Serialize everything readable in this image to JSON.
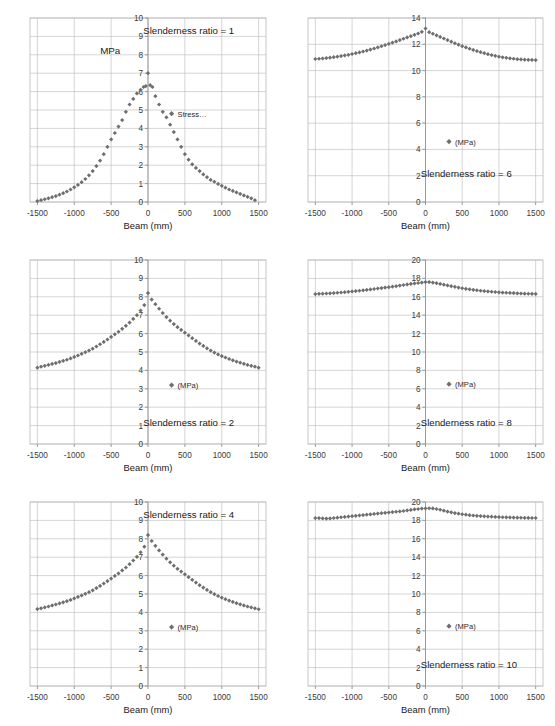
{
  "figure": {
    "layout": "2 columns x 3 rows of scatter plots",
    "background_color": "#ffffff",
    "marker_color": "#6e6e6e",
    "grid_color": "#b9b9b9",
    "axis_color": "#9a9a9a",
    "text_color": "#1a1a1a"
  },
  "shared": {
    "xlabel": "Beam (mm)",
    "xticks": [
      "-1500",
      "-1000",
      "-500",
      "0",
      "500",
      "1000",
      "1500"
    ],
    "unit_label": "MPa",
    "legend_mpa": "(MPa)",
    "legend_stress": "Stress…",
    "marker_symbol": "diamond"
  },
  "chart_data": [
    {
      "type": "scatter",
      "title": "",
      "annotation": "Slenderness ratio = 1",
      "annotation_pos": "top-right",
      "legend": [
        "Stress…"
      ],
      "legend_pos": "right-middle",
      "extra_label": "MPa",
      "xlabel": "Beam (mm)",
      "ylabel": "",
      "xlim": [
        -1600,
        1600
      ],
      "ylim": [
        0,
        10
      ],
      "yticks": [
        0,
        1,
        2,
        3,
        4,
        5,
        6,
        7,
        8,
        9,
        10
      ],
      "xticks": [
        -1500,
        -1000,
        -500,
        0,
        500,
        1000,
        1500
      ],
      "grid": true,
      "peak_value": 7.0,
      "edge_value": 0.05,
      "x": [
        -1500,
        -1450,
        -1400,
        -1350,
        -1300,
        -1250,
        -1200,
        -1150,
        -1100,
        -1050,
        -1000,
        -950,
        -900,
        -850,
        -800,
        -750,
        -700,
        -650,
        -600,
        -550,
        -500,
        -450,
        -400,
        -350,
        -300,
        -250,
        -200,
        -150,
        -100,
        -60,
        -30,
        0,
        30,
        60,
        100,
        150,
        200,
        250,
        300,
        350,
        400,
        450,
        500,
        550,
        600,
        650,
        700,
        750,
        800,
        850,
        900,
        950,
        1000,
        1050,
        1100,
        1150,
        1200,
        1250,
        1300,
        1350,
        1400,
        1450
      ],
      "y": [
        0.05,
        0.1,
        0.15,
        0.2,
        0.26,
        0.32,
        0.4,
        0.48,
        0.57,
        0.68,
        0.8,
        0.93,
        1.08,
        1.25,
        1.45,
        1.68,
        1.95,
        2.25,
        2.6,
        3.0,
        3.4,
        3.75,
        4.1,
        4.45,
        4.9,
        5.3,
        5.6,
        5.9,
        6.1,
        6.25,
        6.3,
        7.0,
        6.35,
        6.25,
        5.75,
        5.3,
        4.9,
        4.6,
        4.2,
        3.8,
        3.4,
        3.0,
        2.6,
        2.3,
        2.05,
        1.85,
        1.68,
        1.5,
        1.35,
        1.2,
        1.1,
        0.98,
        0.88,
        0.78,
        0.68,
        0.6,
        0.52,
        0.44,
        0.36,
        0.28,
        0.2,
        0.1
      ]
    },
    {
      "type": "scatter",
      "title": "",
      "annotation": "Slenderness ratio = 6",
      "annotation_pos": "bottom-right",
      "legend": [
        "(MPa)"
      ],
      "legend_pos": "right-middle",
      "xlabel": "Beam (mm)",
      "ylabel": "",
      "xlim": [
        -1600,
        1600
      ],
      "ylim": [
        0,
        14
      ],
      "yticks": [
        0,
        2,
        4,
        6,
        8,
        10,
        12,
        14
      ],
      "xticks": [
        -1500,
        -1000,
        -500,
        0,
        500,
        1000,
        1500
      ],
      "grid": true,
      "peak_value": 13.2,
      "edge_value": 10.9,
      "x": [
        -1500,
        -1450,
        -1400,
        -1350,
        -1300,
        -1250,
        -1200,
        -1150,
        -1100,
        -1050,
        -1000,
        -950,
        -900,
        -850,
        -800,
        -750,
        -700,
        -650,
        -600,
        -550,
        -500,
        -450,
        -400,
        -350,
        -300,
        -250,
        -200,
        -150,
        -100,
        -50,
        0,
        50,
        100,
        150,
        200,
        250,
        300,
        350,
        400,
        450,
        500,
        550,
        600,
        650,
        700,
        750,
        800,
        850,
        900,
        950,
        1000,
        1050,
        1100,
        1150,
        1200,
        1250,
        1300,
        1350,
        1400,
        1450,
        1500
      ],
      "y": [
        10.88,
        10.9,
        10.92,
        10.95,
        10.98,
        11.02,
        11.06,
        11.1,
        11.15,
        11.2,
        11.26,
        11.32,
        11.38,
        11.45,
        11.52,
        11.6,
        11.68,
        11.76,
        11.85,
        11.94,
        12.03,
        12.12,
        12.22,
        12.32,
        12.42,
        12.52,
        12.62,
        12.72,
        12.82,
        12.95,
        13.2,
        12.92,
        12.8,
        12.68,
        12.56,
        12.44,
        12.32,
        12.2,
        12.08,
        11.97,
        11.86,
        11.76,
        11.66,
        11.57,
        11.48,
        11.4,
        11.32,
        11.25,
        11.18,
        11.12,
        11.06,
        11.01,
        10.97,
        10.93,
        10.9,
        10.87,
        10.85,
        10.83,
        10.82,
        10.81,
        10.8
      ]
    },
    {
      "type": "scatter",
      "title": "",
      "annotation": "Slenderness ratio = 2",
      "annotation_pos": "bottom-right",
      "legend": [
        "(MPa)"
      ],
      "legend_pos": "right-middle",
      "xlabel": "Beam (mm)",
      "ylabel": "",
      "xlim": [
        -1600,
        1600
      ],
      "ylim": [
        0,
        10
      ],
      "yticks": [
        0,
        1,
        2,
        3,
        4,
        5,
        6,
        7,
        8,
        9,
        10
      ],
      "xticks": [
        -1500,
        -1000,
        -500,
        0,
        500,
        1000,
        1500
      ],
      "grid": true,
      "peak_value": 8.2,
      "edge_value": 4.15,
      "x": [
        -1500,
        -1450,
        -1400,
        -1350,
        -1300,
        -1250,
        -1200,
        -1150,
        -1100,
        -1050,
        -1000,
        -950,
        -900,
        -850,
        -800,
        -750,
        -700,
        -650,
        -600,
        -550,
        -500,
        -450,
        -400,
        -350,
        -300,
        -250,
        -200,
        -150,
        -100,
        -50,
        0,
        50,
        100,
        150,
        200,
        250,
        300,
        350,
        400,
        450,
        500,
        550,
        600,
        650,
        700,
        750,
        800,
        850,
        900,
        950,
        1000,
        1050,
        1100,
        1150,
        1200,
        1250,
        1300,
        1350,
        1400,
        1450,
        1500
      ],
      "y": [
        4.15,
        4.2,
        4.25,
        4.3,
        4.35,
        4.4,
        4.46,
        4.52,
        4.58,
        4.65,
        4.73,
        4.81,
        4.9,
        4.99,
        5.08,
        5.18,
        5.3,
        5.42,
        5.55,
        5.68,
        5.82,
        5.96,
        6.1,
        6.26,
        6.42,
        6.6,
        6.8,
        7.0,
        7.25,
        7.55,
        8.2,
        7.85,
        7.6,
        7.35,
        7.12,
        6.9,
        6.7,
        6.52,
        6.35,
        6.2,
        6.05,
        5.9,
        5.75,
        5.6,
        5.46,
        5.33,
        5.2,
        5.08,
        4.97,
        4.87,
        4.78,
        4.7,
        4.62,
        4.55,
        4.48,
        4.42,
        4.36,
        4.3,
        4.25,
        4.2,
        4.15
      ]
    },
    {
      "type": "scatter",
      "title": "",
      "annotation": "Slenderness ratio = 8",
      "annotation_pos": "bottom-right",
      "legend": [
        "(MPa)"
      ],
      "legend_pos": "right-middle",
      "xlabel": "Beam (mm)",
      "ylabel": "",
      "xlim": [
        -1600,
        1600
      ],
      "ylim": [
        0,
        20
      ],
      "yticks": [
        0,
        2,
        4,
        6,
        8,
        10,
        12,
        14,
        16,
        18,
        20
      ],
      "xticks": [
        -1500,
        -1000,
        -500,
        0,
        500,
        1000,
        1500
      ],
      "grid": true,
      "peak_value": 17.6,
      "edge_value": 16.3,
      "x": [
        -1500,
        -1450,
        -1400,
        -1350,
        -1300,
        -1250,
        -1200,
        -1150,
        -1100,
        -1050,
        -1000,
        -950,
        -900,
        -850,
        -800,
        -750,
        -700,
        -650,
        -600,
        -550,
        -500,
        -450,
        -400,
        -350,
        -300,
        -250,
        -200,
        -150,
        -100,
        -50,
        0,
        50,
        100,
        150,
        200,
        250,
        300,
        350,
        400,
        450,
        500,
        550,
        600,
        650,
        700,
        750,
        800,
        850,
        900,
        950,
        1000,
        1050,
        1100,
        1150,
        1200,
        1250,
        1300,
        1350,
        1400,
        1450,
        1500
      ],
      "y": [
        16.3,
        16.32,
        16.34,
        16.36,
        16.38,
        16.41,
        16.44,
        16.47,
        16.5,
        16.54,
        16.58,
        16.62,
        16.66,
        16.7,
        16.75,
        16.8,
        16.85,
        16.9,
        16.95,
        17.0,
        17.05,
        17.1,
        17.16,
        17.22,
        17.28,
        17.34,
        17.4,
        17.45,
        17.5,
        17.55,
        17.6,
        17.6,
        17.55,
        17.48,
        17.4,
        17.32,
        17.24,
        17.16,
        17.08,
        17.0,
        16.93,
        16.87,
        16.81,
        16.76,
        16.71,
        16.66,
        16.62,
        16.58,
        16.55,
        16.52,
        16.49,
        16.46,
        16.44,
        16.42,
        16.4,
        16.38,
        16.36,
        16.34,
        16.33,
        16.32,
        16.31
      ]
    },
    {
      "type": "scatter",
      "title": "",
      "annotation": "Slenderness ratio = 4",
      "annotation_pos": "top-right",
      "legend": [
        "(MPa)"
      ],
      "legend_pos": "right-middle",
      "xlabel": "Beam (mm)",
      "ylabel": "",
      "xlim": [
        -1600,
        1600
      ],
      "ylim": [
        0,
        10
      ],
      "yticks": [
        0,
        1,
        2,
        3,
        4,
        5,
        6,
        7,
        8,
        9,
        10
      ],
      "xticks": [
        -1500,
        -1000,
        -500,
        0,
        500,
        1000,
        1500
      ],
      "grid": true,
      "peak_value": 8.2,
      "edge_value": 4.15,
      "x": [
        -1500,
        -1450,
        -1400,
        -1350,
        -1300,
        -1250,
        -1200,
        -1150,
        -1100,
        -1050,
        -1000,
        -950,
        -900,
        -850,
        -800,
        -750,
        -700,
        -650,
        -600,
        -550,
        -500,
        -450,
        -400,
        -350,
        -300,
        -250,
        -200,
        -150,
        -100,
        -50,
        0,
        50,
        100,
        150,
        200,
        250,
        300,
        350,
        400,
        450,
        500,
        550,
        600,
        650,
        700,
        750,
        800,
        850,
        900,
        950,
        1000,
        1050,
        1100,
        1150,
        1200,
        1250,
        1300,
        1350,
        1400,
        1450,
        1500
      ],
      "y": [
        4.18,
        4.22,
        4.27,
        4.32,
        4.38,
        4.43,
        4.49,
        4.55,
        4.61,
        4.68,
        4.76,
        4.84,
        4.92,
        5.01,
        5.1,
        5.2,
        5.32,
        5.44,
        5.57,
        5.7,
        5.84,
        5.98,
        6.12,
        6.28,
        6.44,
        6.62,
        6.82,
        7.02,
        7.27,
        7.57,
        8.2,
        7.88,
        7.62,
        7.37,
        7.14,
        6.92,
        6.72,
        6.54,
        6.37,
        6.22,
        6.07,
        5.92,
        5.77,
        5.62,
        5.48,
        5.35,
        5.22,
        5.1,
        4.99,
        4.89,
        4.8,
        4.72,
        4.64,
        4.57,
        4.5,
        4.44,
        4.38,
        4.32,
        4.27,
        4.22,
        4.17
      ]
    },
    {
      "type": "scatter",
      "title": "",
      "annotation": "Slenderness ratio = 10",
      "annotation_pos": "bottom-right",
      "legend": [
        "(MPa)"
      ],
      "legend_pos": "right-middle",
      "xlabel": "Beam (mm)",
      "ylabel": "",
      "xlim": [
        -1600,
        1600
      ],
      "ylim": [
        0,
        20
      ],
      "yticks": [
        0,
        2,
        4,
        6,
        8,
        10,
        12,
        14,
        16,
        18,
        20
      ],
      "xticks": [
        -1500,
        -1000,
        -500,
        0,
        500,
        1000,
        1500
      ],
      "grid": true,
      "peak_value": 19.3,
      "edge_value": 18.2,
      "x": [
        -1500,
        -1450,
        -1400,
        -1350,
        -1300,
        -1250,
        -1200,
        -1150,
        -1100,
        -1050,
        -1000,
        -950,
        -900,
        -850,
        -800,
        -750,
        -700,
        -650,
        -600,
        -550,
        -500,
        -450,
        -400,
        -350,
        -300,
        -250,
        -200,
        -150,
        -100,
        -50,
        0,
        50,
        100,
        150,
        200,
        250,
        300,
        350,
        400,
        450,
        500,
        550,
        600,
        650,
        700,
        750,
        800,
        850,
        900,
        950,
        1000,
        1050,
        1100,
        1150,
        1200,
        1250,
        1300,
        1350,
        1400,
        1450,
        1500
      ],
      "y": [
        18.25,
        18.25,
        18.22,
        18.2,
        18.22,
        18.26,
        18.3,
        18.34,
        18.38,
        18.42,
        18.46,
        18.5,
        18.54,
        18.58,
        18.62,
        18.66,
        18.7,
        18.74,
        18.78,
        18.82,
        18.86,
        18.9,
        18.94,
        18.98,
        19.02,
        19.08,
        19.14,
        19.2,
        19.24,
        19.28,
        19.3,
        19.32,
        19.3,
        19.24,
        19.16,
        19.06,
        18.96,
        18.88,
        18.8,
        18.73,
        18.67,
        18.62,
        18.57,
        18.53,
        18.5,
        18.47,
        18.44,
        18.42,
        18.4,
        18.38,
        18.36,
        18.34,
        18.33,
        18.32,
        18.31,
        18.3,
        18.29,
        18.28,
        18.27,
        18.26,
        18.26
      ]
    }
  ]
}
